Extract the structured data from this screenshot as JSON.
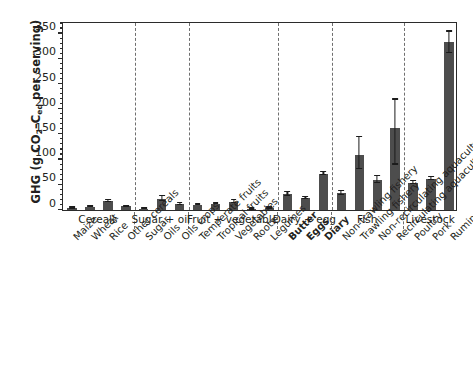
{
  "chart_data": {
    "type": "bar",
    "title": "",
    "xlabel": "",
    "ylabel": "GHG (g CO2–Ceq per serving)",
    "ylabel_parts": {
      "pre": "GHG (g CO",
      "sub1": "2",
      "mid": "–C",
      "sub2": "eq",
      "post": " per serving)"
    },
    "ylim": [
      0,
      375
    ],
    "ytick_values": [
      0,
      50,
      100,
      150,
      200,
      250,
      300,
      350
    ],
    "ytick_labels": [
      "0",
      "50",
      "100",
      "150",
      "200",
      "250",
      "300",
      "350"
    ],
    "yminor_step": 10,
    "grid": false,
    "legend": "none",
    "bar_color": "#4d4d4d",
    "error_color": "#1c1c1c",
    "axis_color": "#2b2b2b",
    "separator_color": "#6f6f6f",
    "categories": [
      "Maize",
      "Wheat",
      "Rice",
      "Other cereals",
      "Sugar",
      "Oils",
      "Oils crops",
      "Temperate fruits",
      "Tropical fruits",
      "Vegetables",
      "Roots",
      "Legumes",
      "Butter",
      "Eggs",
      "Diary",
      "Non-trawling fishery",
      "Trawling fishery",
      "Non-recirculating aquaculture",
      "Recirculating aquaculture",
      "Poultry",
      "Pork",
      "Ruminant meat"
    ],
    "values": [
      4,
      6,
      17,
      7,
      3,
      22,
      11,
      10,
      12,
      16,
      2,
      4,
      31,
      23,
      72,
      33,
      110,
      60,
      162,
      54,
      62,
      334
    ],
    "err_low": [
      1,
      1,
      2,
      1,
      1,
      4,
      2,
      1,
      1,
      3,
      1,
      1,
      3,
      2,
      3,
      4,
      28,
      7,
      72,
      3,
      3,
      22
    ],
    "err_high": [
      1,
      1,
      3,
      1,
      1,
      5,
      2,
      1,
      1,
      3,
      1,
      1,
      4,
      2,
      3,
      4,
      35,
      7,
      57,
      3,
      3,
      20
    ],
    "bold_labels": [
      "Butter",
      "Eggs",
      "Diary"
    ],
    "groups": [
      {
        "label": "Cereals",
        "start": 0,
        "end": 3
      },
      {
        "label": "Sugar + oil",
        "start": 4,
        "end": 6
      },
      {
        "label": "Fruit + vegetable",
        "start": 7,
        "end": 11
      },
      {
        "label": "Dairy + egg",
        "start": 12,
        "end": 14
      },
      {
        "label": "Fish",
        "start": 15,
        "end": 18
      },
      {
        "label": "Livestock",
        "start": 19,
        "end": 21
      }
    ]
  }
}
